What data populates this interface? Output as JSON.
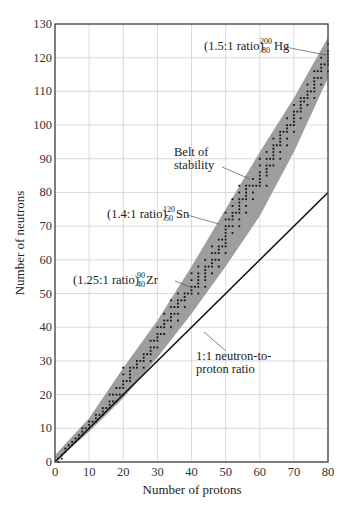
{
  "chart_data": {
    "type": "scatter",
    "title": "",
    "xlabel": "Number of protons",
    "ylabel": "Number of neutrons",
    "xlim": [
      0,
      80
    ],
    "ylim": [
      0,
      130
    ],
    "xticks": [
      0,
      10,
      20,
      30,
      40,
      50,
      60,
      70,
      80
    ],
    "yticks": [
      0,
      10,
      20,
      30,
      40,
      50,
      60,
      70,
      80,
      90,
      100,
      110,
      120,
      130
    ],
    "grid": true,
    "colors": {
      "belt": "#9e9e9e",
      "points": "#111111",
      "line": "#111111",
      "grid": "#d0d0d0",
      "axis": "#444444"
    },
    "belt_of_stability": {
      "label": "Belt of stability",
      "lower": [
        [
          0,
          0
        ],
        [
          10,
          9
        ],
        [
          20,
          19
        ],
        [
          30,
          31
        ],
        [
          40,
          44
        ],
        [
          50,
          58
        ],
        [
          60,
          73
        ],
        [
          70,
          92
        ],
        [
          80,
          114
        ]
      ],
      "upper": [
        [
          0,
          2
        ],
        [
          10,
          13
        ],
        [
          20,
          28
        ],
        [
          30,
          42
        ],
        [
          40,
          58
        ],
        [
          50,
          75
        ],
        [
          60,
          92
        ],
        [
          70,
          108
        ],
        [
          80,
          126
        ]
      ]
    },
    "reference_line": {
      "label": "1:1 neutron-to-proton ratio",
      "from": [
        0,
        0
      ],
      "to": [
        80,
        80
      ]
    },
    "annotations": [
      {
        "text": "(1.5:1 ratio)",
        "mass": "200",
        "z": "80",
        "symbol": "Hg",
        "point": [
          80,
          120
        ]
      },
      {
        "text": "(1.4:1 ratio)",
        "mass": "120",
        "z": "50",
        "symbol": "Sn",
        "point": [
          50,
          70
        ]
      },
      {
        "text": "(1.25:1 ratio)",
        "mass": "90",
        "z": "40",
        "symbol": "Zr",
        "point": [
          40,
          50
        ]
      },
      {
        "text": "Belt of",
        "text2": "stability"
      },
      {
        "text": "1:1 neutron-to-",
        "text2": "proton ratio"
      }
    ],
    "stable_nuclides": [
      [
        1,
        0
      ],
      [
        1,
        1
      ],
      [
        2,
        1
      ],
      [
        2,
        2
      ],
      [
        3,
        3
      ],
      [
        3,
        4
      ],
      [
        4,
        5
      ],
      [
        5,
        5
      ],
      [
        5,
        6
      ],
      [
        6,
        6
      ],
      [
        6,
        7
      ],
      [
        7,
        7
      ],
      [
        7,
        8
      ],
      [
        8,
        8
      ],
      [
        8,
        9
      ],
      [
        8,
        10
      ],
      [
        9,
        10
      ],
      [
        10,
        10
      ],
      [
        10,
        11
      ],
      [
        10,
        12
      ],
      [
        11,
        12
      ],
      [
        12,
        12
      ],
      [
        12,
        13
      ],
      [
        12,
        14
      ],
      [
        13,
        14
      ],
      [
        14,
        14
      ],
      [
        14,
        15
      ],
      [
        14,
        16
      ],
      [
        15,
        16
      ],
      [
        16,
        16
      ],
      [
        16,
        17
      ],
      [
        16,
        18
      ],
      [
        16,
        20
      ],
      [
        17,
        18
      ],
      [
        17,
        20
      ],
      [
        18,
        18
      ],
      [
        18,
        20
      ],
      [
        18,
        22
      ],
      [
        19,
        20
      ],
      [
        19,
        22
      ],
      [
        20,
        20
      ],
      [
        20,
        22
      ],
      [
        20,
        23
      ],
      [
        20,
        24
      ],
      [
        20,
        26
      ],
      [
        20,
        28
      ],
      [
        21,
        24
      ],
      [
        22,
        24
      ],
      [
        22,
        25
      ],
      [
        22,
        26
      ],
      [
        22,
        27
      ],
      [
        22,
        28
      ],
      [
        23,
        28
      ],
      [
        24,
        28
      ],
      [
        24,
        29
      ],
      [
        24,
        30
      ],
      [
        25,
        30
      ],
      [
        26,
        28
      ],
      [
        26,
        30
      ],
      [
        26,
        31
      ],
      [
        26,
        32
      ],
      [
        27,
        32
      ],
      [
        28,
        30
      ],
      [
        28,
        32
      ],
      [
        28,
        33
      ],
      [
        28,
        34
      ],
      [
        28,
        36
      ],
      [
        29,
        34
      ],
      [
        29,
        36
      ],
      [
        30,
        34
      ],
      [
        30,
        36
      ],
      [
        30,
        37
      ],
      [
        30,
        38
      ],
      [
        30,
        40
      ],
      [
        31,
        38
      ],
      [
        31,
        40
      ],
      [
        32,
        38
      ],
      [
        32,
        40
      ],
      [
        32,
        41
      ],
      [
        32,
        42
      ],
      [
        32,
        44
      ],
      [
        33,
        42
      ],
      [
        34,
        40
      ],
      [
        34,
        42
      ],
      [
        34,
        43
      ],
      [
        34,
        44
      ],
      [
        34,
        46
      ],
      [
        34,
        48
      ],
      [
        35,
        44
      ],
      [
        35,
        46
      ],
      [
        36,
        42
      ],
      [
        36,
        44
      ],
      [
        36,
        46
      ],
      [
        36,
        47
      ],
      [
        36,
        48
      ],
      [
        36,
        50
      ],
      [
        37,
        48
      ],
      [
        38,
        46
      ],
      [
        38,
        48
      ],
      [
        38,
        49
      ],
      [
        38,
        50
      ],
      [
        39,
        50
      ],
      [
        40,
        50
      ],
      [
        40,
        51
      ],
      [
        40,
        52
      ],
      [
        40,
        54
      ],
      [
        40,
        56
      ],
      [
        41,
        52
      ],
      [
        42,
        50
      ],
      [
        42,
        52
      ],
      [
        42,
        53
      ],
      [
        42,
        54
      ],
      [
        42,
        55
      ],
      [
        42,
        56
      ],
      [
        42,
        58
      ],
      [
        44,
        52
      ],
      [
        44,
        54
      ],
      [
        44,
        55
      ],
      [
        44,
        56
      ],
      [
        44,
        57
      ],
      [
        44,
        58
      ],
      [
        44,
        60
      ],
      [
        45,
        58
      ],
      [
        46,
        56
      ],
      [
        46,
        58
      ],
      [
        46,
        59
      ],
      [
        46,
        60
      ],
      [
        46,
        62
      ],
      [
        46,
        64
      ],
      [
        47,
        60
      ],
      [
        47,
        62
      ],
      [
        48,
        58
      ],
      [
        48,
        60
      ],
      [
        48,
        62
      ],
      [
        48,
        63
      ],
      [
        48,
        64
      ],
      [
        48,
        66
      ],
      [
        49,
        64
      ],
      [
        49,
        66
      ],
      [
        50,
        62
      ],
      [
        50,
        64
      ],
      [
        50,
        65
      ],
      [
        50,
        66
      ],
      [
        50,
        67
      ],
      [
        50,
        68
      ],
      [
        50,
        69
      ],
      [
        50,
        70
      ],
      [
        50,
        72
      ],
      [
        50,
        74
      ],
      [
        51,
        70
      ],
      [
        51,
        72
      ],
      [
        52,
        68
      ],
      [
        52,
        70
      ],
      [
        52,
        72
      ],
      [
        52,
        73
      ],
      [
        52,
        74
      ],
      [
        52,
        76
      ],
      [
        52,
        78
      ],
      [
        53,
        74
      ],
      [
        54,
        70
      ],
      [
        54,
        72
      ],
      [
        54,
        74
      ],
      [
        54,
        75
      ],
      [
        54,
        76
      ],
      [
        54,
        77
      ],
      [
        54,
        78
      ],
      [
        54,
        80
      ],
      [
        54,
        82
      ],
      [
        55,
        78
      ],
      [
        56,
        74
      ],
      [
        56,
        76
      ],
      [
        56,
        78
      ],
      [
        56,
        79
      ],
      [
        56,
        80
      ],
      [
        56,
        81
      ],
      [
        56,
        82
      ],
      [
        57,
        82
      ],
      [
        58,
        78
      ],
      [
        58,
        80
      ],
      [
        58,
        82
      ],
      [
        58,
        84
      ],
      [
        59,
        82
      ],
      [
        60,
        82
      ],
      [
        60,
        83
      ],
      [
        60,
        84
      ],
      [
        60,
        85
      ],
      [
        60,
        86
      ],
      [
        60,
        88
      ],
      [
        60,
        90
      ],
      [
        62,
        82
      ],
      [
        62,
        85
      ],
      [
        62,
        86
      ],
      [
        62,
        87
      ],
      [
        62,
        88
      ],
      [
        62,
        90
      ],
      [
        62,
        92
      ],
      [
        63,
        88
      ],
      [
        63,
        90
      ],
      [
        64,
        88
      ],
      [
        64,
        90
      ],
      [
        64,
        91
      ],
      [
        64,
        92
      ],
      [
        64,
        93
      ],
      [
        64,
        94
      ],
      [
        64,
        96
      ],
      [
        65,
        94
      ],
      [
        66,
        90
      ],
      [
        66,
        92
      ],
      [
        66,
        94
      ],
      [
        66,
        95
      ],
      [
        66,
        96
      ],
      [
        66,
        97
      ],
      [
        66,
        98
      ],
      [
        67,
        98
      ],
      [
        68,
        94
      ],
      [
        68,
        96
      ],
      [
        68,
        98
      ],
      [
        68,
        99
      ],
      [
        68,
        100
      ],
      [
        68,
        102
      ],
      [
        69,
        100
      ],
      [
        70,
        98
      ],
      [
        70,
        100
      ],
      [
        70,
        101
      ],
      [
        70,
        102
      ],
      [
        70,
        103
      ],
      [
        70,
        104
      ],
      [
        70,
        106
      ],
      [
        71,
        104
      ],
      [
        72,
        102
      ],
      [
        72,
        104
      ],
      [
        72,
        105
      ],
      [
        72,
        106
      ],
      [
        72,
        107
      ],
      [
        72,
        108
      ],
      [
        73,
        107
      ],
      [
        73,
        108
      ],
      [
        74,
        106
      ],
      [
        74,
        108
      ],
      [
        74,
        109
      ],
      [
        74,
        110
      ],
      [
        74,
        112
      ],
      [
        75,
        110
      ],
      [
        76,
        108
      ],
      [
        76,
        110
      ],
      [
        76,
        111
      ],
      [
        76,
        112
      ],
      [
        76,
        113
      ],
      [
        76,
        114
      ],
      [
        76,
        116
      ],
      [
        77,
        114
      ],
      [
        77,
        116
      ],
      [
        78,
        112
      ],
      [
        78,
        114
      ],
      [
        78,
        116
      ],
      [
        78,
        117
      ],
      [
        78,
        118
      ],
      [
        78,
        120
      ],
      [
        79,
        118
      ],
      [
        80,
        116
      ],
      [
        80,
        118
      ],
      [
        80,
        119
      ],
      [
        80,
        120
      ],
      [
        80,
        121
      ],
      [
        80,
        122
      ],
      [
        80,
        124
      ]
    ]
  }
}
